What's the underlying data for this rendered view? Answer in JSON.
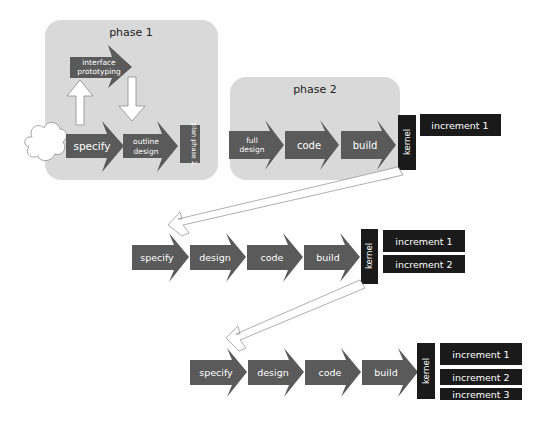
{
  "colors": {
    "background": "#ffffff",
    "phase_box": "#d9d9d9",
    "arrow": "#5a5a5a",
    "dark_box": "#1a1a1a",
    "outline": "#8c8c8c",
    "text_light": "#ffffff",
    "text_dark": "#222222"
  },
  "phase1": {
    "title": "phase 1",
    "interface_prototyping": [
      "interface",
      "prototyping"
    ],
    "specify": "specify",
    "outline_design": [
      "outline",
      "design"
    ],
    "plan_phase_2": "plan phase 2"
  },
  "phase2": {
    "title": "phase 2",
    "full_design": [
      "full",
      "design"
    ],
    "code": "code",
    "build": "build",
    "kernel": "kernel",
    "increments": [
      "increment 1"
    ]
  },
  "iteration2": {
    "steps": [
      "specify",
      "design",
      "code",
      "build"
    ],
    "kernel": "kernel",
    "increments": [
      "increment 1",
      "increment 2"
    ]
  },
  "iteration3": {
    "steps": [
      "specify",
      "design",
      "code",
      "build"
    ],
    "kernel": "kernel",
    "increments": [
      "increment 1",
      "increment 2",
      "increment 3"
    ]
  }
}
